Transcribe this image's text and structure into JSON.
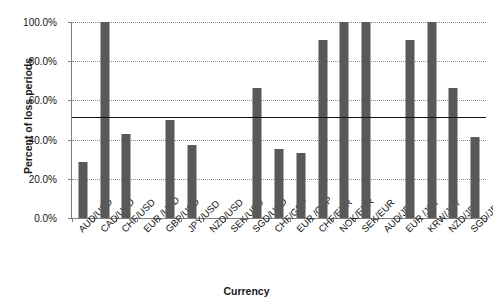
{
  "chart_data": {
    "type": "bar",
    "title": "",
    "xlabel": "Currency",
    "ylabel": "Percent of loss periods",
    "ylim": [
      0,
      100
    ],
    "ytick_labels": [
      "0.0%",
      "20.0%",
      "40.0%",
      "60.0%",
      "80.0%",
      "100.0%"
    ],
    "ytick_values": [
      0,
      20,
      40,
      60,
      80,
      100
    ],
    "grid": true,
    "legend": "none",
    "bar_color": "#595959",
    "reference_line": {
      "value": 51.5,
      "color": "#111111",
      "label": ""
    },
    "categories": [
      "AUD/USD",
      "CAD/USD",
      "CHF/USD",
      "EUR /USD",
      "GBP/USD",
      "JPY/USD",
      "NZD/USD",
      "SEK/USD",
      "SGD/USD",
      "CHF/GBP",
      "EUR /GBP",
      "CHF/EUR",
      "NOK/EUR",
      "SEK/EUR",
      "AUD/JPY",
      "EUR /JPY",
      "KRW/JPY",
      "NZD/JPY",
      "SGD/JPY"
    ],
    "values": [
      28.5,
      100.0,
      43.0,
      0.0,
      50.0,
      37.5,
      0.0,
      0.0,
      66.5,
      35.0,
      33.0,
      91.0,
      100.0,
      100.0,
      0.0,
      91.0,
      100.0,
      66.5,
      41.5
    ]
  }
}
